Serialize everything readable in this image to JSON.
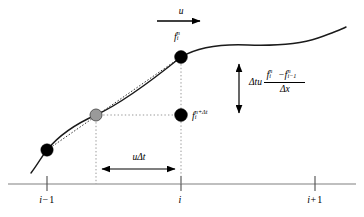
{
  "figure": {
    "width": 364,
    "height": 217,
    "background_color": "#ffffff"
  },
  "colors": {
    "curve": "#1a1a1a",
    "axis": "#808080",
    "dotted": "#999999",
    "node_black": "#000000",
    "node_gray": "#9a9a9a",
    "node_stroke": "#4d4d4d",
    "arrow": "#000000",
    "text": "#000000"
  },
  "axis": {
    "name": "grid-axis",
    "y": 184,
    "x_start": 8,
    "x_end": 356,
    "ticks": [
      {
        "x": 47,
        "label_text": "i",
        "label_op": "−",
        "label_num": "1",
        "name": "tick-i-minus-1"
      },
      {
        "x": 181,
        "label_text": "i",
        "label_op": "",
        "label_num": "",
        "name": "tick-i"
      },
      {
        "x": 315,
        "label_text": "i",
        "label_op": "+",
        "label_num": "1",
        "name": "tick-i-plus-1"
      }
    ],
    "tick_label_y": 195
  },
  "velocity_arrow": {
    "name": "velocity-arrow",
    "label": "u",
    "label_x": 181,
    "label_y": 8,
    "x_start": 157,
    "x_end": 206,
    "y": 21
  },
  "shift_arrow": {
    "name": "shift-arrow",
    "label_base": "u",
    "label_delta": "Δt",
    "label_x": 139,
    "label_y": 155,
    "x_start": 96,
    "x_end": 181,
    "y": 169
  },
  "flux_arrow": {
    "name": "flux-arrow",
    "x": 239,
    "y_top": 58,
    "y_bottom": 119
  },
  "flux_expression": {
    "name": "flux-expression",
    "x": 249,
    "y": 79,
    "lead_delta": "Δ",
    "lead_t": "t",
    "lead_u": "u",
    "num_f1": "f",
    "num_f1_sup": "n",
    "num_f1_sub": "i",
    "num_minus": "−",
    "num_f2": "f",
    "num_f2_sup": "n",
    "num_f2_sub": "i−1",
    "den_delta": "Δ",
    "den_x": "x"
  },
  "curve": {
    "name": "solution-curve",
    "path": "M 31,173 C 38,164 42,156 47,150 C 60,134 80,122 96,115 C 120,104 155,78 181,57 C 200,46 225,44 248,45 C 278,46 300,44 318,38 C 332,33 340,30 346,27",
    "stroke_width": 1.4
  },
  "chord": {
    "name": "interpolation-chord",
    "x1": 47,
    "y1": 150,
    "x2": 181,
    "y2": 57
  },
  "guides": [
    {
      "name": "guide-vertical-departure",
      "x1": 96,
      "y1": 115,
      "x2": 96,
      "y2": 184
    },
    {
      "name": "guide-vertical-node-i",
      "x1": 181,
      "y1": 57,
      "x2": 181,
      "y2": 184
    },
    {
      "name": "guide-horizontal-departure",
      "x1": 96,
      "y1": 115,
      "x2": 181,
      "y2": 115
    }
  ],
  "nodes": [
    {
      "name": "node-i-minus-1",
      "x": 47,
      "y": 150,
      "r": 6.2,
      "fill": "#000000",
      "label": null
    },
    {
      "name": "node-departure-point",
      "x": 96,
      "y": 115,
      "r": 6.0,
      "fill": "#9a9a9a",
      "label": null
    },
    {
      "name": "node-i-current",
      "x": 181,
      "y": 57,
      "r": 6.4,
      "fill": "#000000",
      "label": "f_i^n"
    },
    {
      "name": "node-i-updated",
      "x": 181,
      "y": 115,
      "r": 6.4,
      "fill": "#000000",
      "label": "f_i^{n+dt}"
    }
  ],
  "node_labels": {
    "top": {
      "name": "label-f-i-n",
      "x": 176,
      "y": 34,
      "f": "f",
      "sup": "n",
      "sub": "i"
    },
    "updated": {
      "name": "label-f-i-n-plus-dt",
      "x": 193,
      "y": 113,
      "f": "f",
      "sup": "n+Δt",
      "sub": "i"
    }
  }
}
